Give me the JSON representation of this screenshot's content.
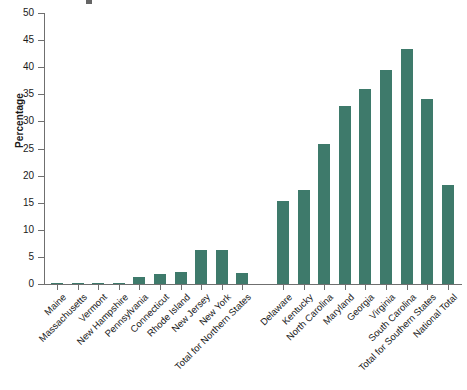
{
  "chart_data": {
    "type": "bar",
    "title": "",
    "subtitle": "",
    "xlabel": "",
    "ylabel": "Percentage",
    "ylim": [
      0,
      50
    ],
    "yticks": [
      0,
      5,
      10,
      15,
      20,
      25,
      30,
      35,
      40,
      45,
      50
    ],
    "grid": false,
    "legend": null,
    "bar_color": "#3e7a6b",
    "axis_color": "#6f6f6f",
    "group_gap_after_index": 9,
    "categories": [
      "Maine",
      "Massachusetts",
      "Vermont",
      "New Hampshire",
      "Pennsylvania",
      "Connecticut",
      "Rhode Island",
      "New Jersey",
      "New York",
      "Total for Northern States",
      "Delaware",
      "Kentucky",
      "North Carolina",
      "Maryland",
      "Georgia",
      "Virginia",
      "South Carolina",
      "Total for Southern States",
      "National Total"
    ],
    "values": [
      0.0,
      0.0,
      0.0,
      0.1,
      1.3,
      1.8,
      2.2,
      6.2,
      6.3,
      2.0,
      15.3,
      17.3,
      25.8,
      32.8,
      35.9,
      39.4,
      43.4,
      34.2,
      18.2
    ]
  }
}
